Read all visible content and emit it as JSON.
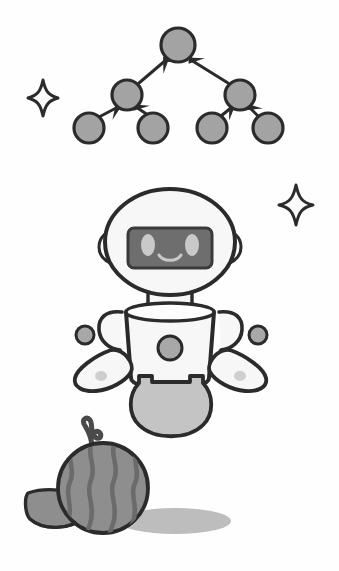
{
  "canvas": {
    "width": 339,
    "height": 571,
    "background_color": "#fefefe",
    "title": "Robot, binary tree diagram, watermelon and sparkles illustration",
    "style": "grayscale flat vector illustration with heavy dark outlines"
  },
  "palette": {
    "outline": "#2b2b2b",
    "outline_soft": "#3a3a3a",
    "node_fill": "#a3a3a3",
    "body_fill": "#f7f7f7",
    "visor_fill": "#6e6e6e",
    "visor_eye_fill": "#c9c9c9",
    "accent_gray": "#a8a8a8",
    "skirt_fill": "#c4c4c4",
    "melon_fill": "#8e8e8e",
    "melon_stripe": "#6b6b6b",
    "shadow_fill": "#bdbdbd",
    "sparkle_fill": "#fbfbfb",
    "white": "#ffffff"
  },
  "objects": [
    {
      "id": "tree-diagram",
      "name": "binary-tree-diagram",
      "label": "Binary tree diagram with 7 nodes and upward arrows",
      "node_count": 7,
      "edge_count": 6,
      "arrow_direction": "child-to-parent (upward)"
    },
    {
      "id": "robot",
      "name": "robot-character",
      "label": "Friendly robot with round head, visor face, arms and hovering orbs"
    },
    {
      "id": "watermelon",
      "name": "watermelon",
      "label": "Striped watermelon with curly stem and cut slice wedge"
    },
    {
      "id": "sparkle-left",
      "name": "sparkle-left",
      "label": "Four pointed sparkle, left side"
    },
    {
      "id": "sparkle-right",
      "name": "sparkle-right",
      "label": "Four pointed sparkle, right side"
    }
  ],
  "tree": {
    "name": "binary-tree",
    "nodes": [
      {
        "id": "root",
        "label": "root node",
        "cx": 178,
        "cy": 45,
        "r": 17
      },
      {
        "id": "l1",
        "label": "left child",
        "cx": 127,
        "cy": 95,
        "r": 15
      },
      {
        "id": "r1",
        "label": "right child",
        "cx": 240,
        "cy": 95,
        "r": 15
      },
      {
        "id": "l2a",
        "label": "left leaf one",
        "cx": 89,
        "cy": 128,
        "r": 15
      },
      {
        "id": "l2b",
        "label": "left leaf two",
        "cx": 153,
        "cy": 128,
        "r": 15
      },
      {
        "id": "r2a",
        "label": "right leaf one",
        "cx": 212,
        "cy": 128,
        "r": 15
      },
      {
        "id": "r2b",
        "label": "right leaf two",
        "cx": 268,
        "cy": 128,
        "r": 15
      }
    ],
    "edges": [
      {
        "from": "l1",
        "to": "root",
        "label": "left child to root"
      },
      {
        "from": "r1",
        "to": "root",
        "label": "right child to root"
      },
      {
        "from": "l2a",
        "to": "l1",
        "label": "left leaf one to left child"
      },
      {
        "from": "l2b",
        "to": "l1",
        "label": "left leaf two to left child"
      },
      {
        "from": "r2a",
        "to": "r1",
        "label": "right leaf one to right child"
      },
      {
        "from": "r2b",
        "to": "r1",
        "label": "right leaf two to right child"
      }
    ]
  },
  "robot": {
    "name": "robot",
    "head": {
      "cx": 170,
      "cy": 242,
      "rx": 65,
      "ry": 53,
      "label": "robot head"
    },
    "visor": {
      "x": 128,
      "y": 228,
      "width": 84,
      "height": 40,
      "radius": 6,
      "label": "robot visor face panel"
    },
    "eyes": [
      {
        "id": "left-eye",
        "cx": 148,
        "cy": 245,
        "rx": 7,
        "ry": 11
      },
      {
        "id": "right-eye",
        "cx": 192,
        "cy": 245,
        "rx": 7,
        "ry": 11
      }
    ],
    "mouth": {
      "label": "smile",
      "path_hint": "upward arc below eyes"
    },
    "ears": [
      {
        "id": "left-ear",
        "cx": 110,
        "cy": 247,
        "label": "left ear module"
      },
      {
        "id": "right-ear",
        "cx": 230,
        "cy": 247,
        "label": "right ear module"
      }
    ],
    "neck": {
      "label": "robot neck"
    },
    "torso": {
      "label": "robot torso",
      "shape": "tapered barrel, wide at top"
    },
    "chest_button": {
      "cx": 170,
      "cy": 348,
      "r": 12,
      "label": "chest button"
    },
    "arms": [
      {
        "id": "left-arm",
        "label": "left arm loop"
      },
      {
        "id": "right-arm",
        "label": "right arm loop"
      }
    ],
    "hands": [
      {
        "id": "left-hand",
        "label": "left mitten hand",
        "dot": {
          "cx": 101,
          "cy": 375,
          "r": 5
        }
      },
      {
        "id": "right-hand",
        "label": "right mitten hand",
        "dot": {
          "cx": 240,
          "cy": 375,
          "r": 5
        }
      }
    ],
    "orbs": [
      {
        "id": "left-orb",
        "cx": 85,
        "cy": 335,
        "r": 9,
        "label": "floating orb left"
      },
      {
        "id": "right-orb",
        "cx": 258,
        "cy": 335,
        "r": 9,
        "label": "floating orb right"
      }
    ],
    "skirt": {
      "label": "robot lower skirt dome",
      "notched_top": true
    }
  },
  "watermelon": {
    "name": "watermelon",
    "body": {
      "cx": 103,
      "cy": 488,
      "r": 45,
      "label": "watermelon body"
    },
    "stripe_count": 4,
    "stem": {
      "label": "curly stem",
      "cx": 91,
      "cy": 440
    },
    "slice": {
      "label": "watermelon slice wedge",
      "seed_count": 3
    },
    "seeds": [
      {
        "cx": 66,
        "cy": 506
      },
      {
        "cx": 77,
        "cy": 503
      },
      {
        "cx": 74,
        "cy": 515
      }
    ],
    "shadow": {
      "cx": 175,
      "cy": 521,
      "rx": 56,
      "ry": 13,
      "label": "ground shadow ellipse"
    }
  },
  "sparkles": [
    {
      "id": "sparkle-left",
      "cx": 43,
      "cy": 98,
      "size": 15,
      "label": "sparkle left of tree"
    },
    {
      "id": "sparkle-right",
      "cx": 296,
      "cy": 205,
      "size": 17,
      "label": "sparkle right of robot"
    }
  ]
}
